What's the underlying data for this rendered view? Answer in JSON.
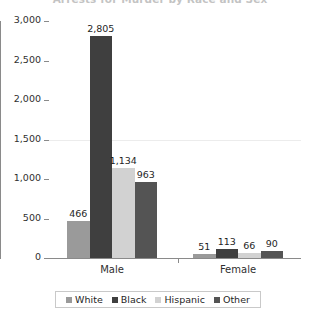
{
  "chart_data": {
    "type": "bar",
    "title": "Arrests for Murder by Race and Sex",
    "title_clipped": true,
    "xlabel": "",
    "ylabel": "",
    "categories": [
      "Male",
      "Female"
    ],
    "series": [
      {
        "name": "White",
        "values": [
          466,
          51
        ],
        "color": "#9a9a9a"
      },
      {
        "name": "Black",
        "values": [
          2805,
          113
        ],
        "color": "#3f3f3f"
      },
      {
        "name": "Hispanic",
        "values": [
          1134,
          66
        ],
        "color": "#d2d2d2"
      },
      {
        "name": "Other",
        "values": [
          963,
          90
        ],
        "color": "#545454"
      }
    ],
    "ylim": [
      0,
      3000
    ],
    "yticks": [
      0,
      500,
      1000,
      1500,
      2000,
      2500,
      3000
    ],
    "ytick_labels": [
      "0",
      "500",
      "1,000",
      "1,500",
      "2,000",
      "2,500",
      "3,000"
    ],
    "data_labels": {
      "Male": [
        "466",
        "2,805",
        "1,134",
        "963"
      ],
      "Female": [
        "51",
        "113",
        "66",
        "90"
      ]
    },
    "grid": "single-faint-line-at-1500",
    "legend_position": "bottom",
    "legend_boxed": true,
    "orientation": "vertical",
    "grouped": true
  },
  "axis": {
    "tick_color": "#8a8a8a",
    "label_color": "#2f2f2f"
  }
}
